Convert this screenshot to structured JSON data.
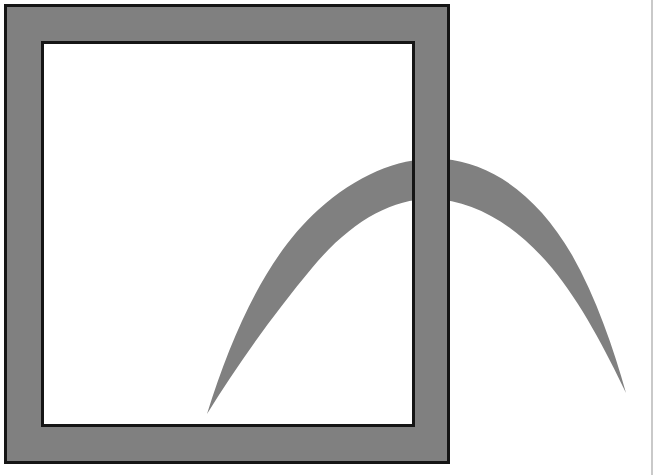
{
  "document": {
    "type": "logo-emblem",
    "canvas": {
      "width": 664,
      "height": 475,
      "background": "#ffffff"
    },
    "title": "Square frame with sweeping crescent arc"
  },
  "palette": {
    "gray_fill": "#808080",
    "outline_dark": "#151515",
    "white": "#ffffff",
    "page_rule": "#c9c9c9"
  },
  "frame": {
    "name": "square-frame",
    "outer": {
      "x": 4,
      "y": 4,
      "width": 446,
      "height": 460
    },
    "inner": {
      "x": 41,
      "y": 41,
      "width": 374,
      "height": 386
    },
    "band_thickness": 37,
    "outline_width": 3,
    "fill": "#808080",
    "outline": "#151515"
  },
  "swoosh": {
    "name": "crescent-arc",
    "fill": "#808080",
    "bottom_tip": {
      "x": 207,
      "y": 414
    },
    "right_tip": {
      "x": 626,
      "y": 393
    },
    "apex": {
      "x": 420,
      "y": 159
    },
    "description": "Tapered crescent sweeping from lower-left tip up over an apex then down to a long right-hand tip, passing behind the frame outlines."
  },
  "page_rule": {
    "name": "vertical-rule",
    "x": 651,
    "width": 2,
    "color": "#c9c9c9"
  }
}
